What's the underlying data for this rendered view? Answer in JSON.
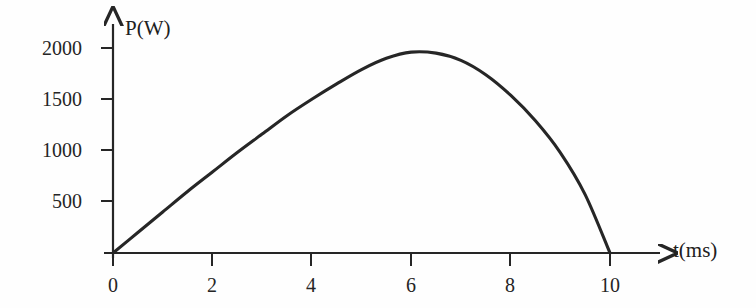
{
  "figure": {
    "background_color": "#fefefe",
    "ink_color": "#262626",
    "width": 756,
    "height": 308
  },
  "axes": {
    "y_axis_title": "P(W)",
    "x_axis_title": "t(ms)",
    "y_tick_labels": [
      "2000",
      "1500",
      "1000",
      "500"
    ],
    "x_tick_labels": [
      "0",
      "2",
      "4",
      "6",
      "8",
      "10"
    ]
  },
  "chart_data": {
    "type": "line",
    "title": "",
    "xlabel": "t(ms)",
    "ylabel": "P(W)",
    "xlim": [
      0,
      10.6
    ],
    "ylim": [
      0,
      2150
    ],
    "grid": false,
    "legend": null,
    "x_ticks": [
      0,
      2,
      4,
      6,
      8,
      10
    ],
    "y_ticks": [
      500,
      1000,
      1500,
      2000
    ],
    "x_unit": "ms",
    "y_unit": "W",
    "annotations": [],
    "series": [
      {
        "name": "P(t)",
        "color": "#262626",
        "x": [
          0,
          0.5,
          1,
          1.5,
          2,
          2.5,
          3,
          3.5,
          4,
          4.5,
          5,
          5.5,
          6,
          6.5,
          7,
          7.5,
          8,
          8.5,
          9,
          9.5,
          10
        ],
        "values": [
          0,
          200,
          400,
          600,
          790,
          980,
          1160,
          1340,
          1500,
          1650,
          1790,
          1900,
          1960,
          1950,
          1880,
          1740,
          1540,
          1290,
          980,
          570,
          0
        ]
      }
    ]
  }
}
